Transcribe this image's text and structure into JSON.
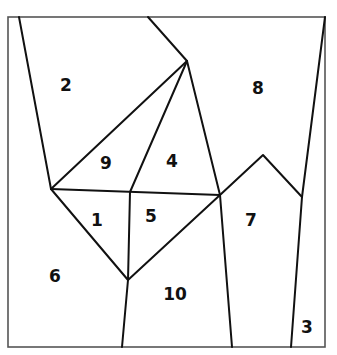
{
  "diagram": {
    "type": "planar-partition",
    "border": {
      "x": 8,
      "y": 17,
      "width": 317,
      "height": 330,
      "color": "#555555"
    },
    "line_color": "#111111",
    "regions": [
      {
        "id": "1",
        "label": "1",
        "x": 97,
        "y": 221
      },
      {
        "id": "2",
        "label": "2",
        "x": 66,
        "y": 86
      },
      {
        "id": "3",
        "label": "3",
        "x": 307,
        "y": 328
      },
      {
        "id": "4",
        "label": "4",
        "x": 172,
        "y": 162
      },
      {
        "id": "5",
        "label": "5",
        "x": 151,
        "y": 217
      },
      {
        "id": "6",
        "label": "6",
        "x": 55,
        "y": 277
      },
      {
        "id": "7",
        "label": "7",
        "x": 251,
        "y": 221
      },
      {
        "id": "8",
        "label": "8",
        "x": 258,
        "y": 89
      },
      {
        "id": "9",
        "label": "9",
        "x": 106,
        "y": 164
      },
      {
        "id": "10",
        "label": "10",
        "x": 175,
        "y": 295
      }
    ]
  }
}
